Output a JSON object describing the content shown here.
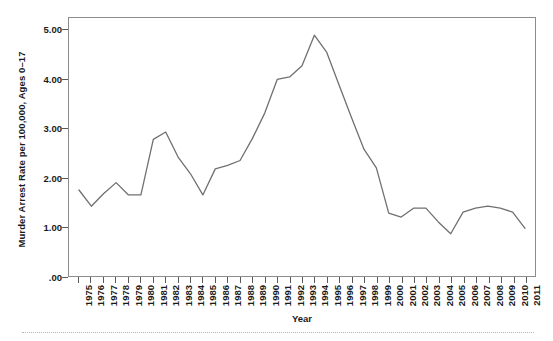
{
  "chart_data": {
    "type": "line",
    "title": "",
    "xlabel": "Year",
    "ylabel": "Murder Arrest Rate per 100,000, Ages 0–17",
    "xlim": [
      1975,
      2011
    ],
    "ylim": [
      0.0,
      5.25
    ],
    "grid": false,
    "legend": null,
    "line_color": "#707070",
    "frame_color": "#8c8c8c",
    "y_ticks": [
      {
        "value": 0.0,
        "label": ".00"
      },
      {
        "value": 1.0,
        "label": "1.00"
      },
      {
        "value": 2.0,
        "label": "2.00"
      },
      {
        "value": 3.0,
        "label": "3.00"
      },
      {
        "value": 4.0,
        "label": "4.00"
      },
      {
        "value": 5.0,
        "label": "5.00"
      }
    ],
    "categories": [
      "1975",
      "1976",
      "1977",
      "1978",
      "1979",
      "1980",
      "1981",
      "1982",
      "1983",
      "1984",
      "1985",
      "1986",
      "1987",
      "1988",
      "1989",
      "1990",
      "1991",
      "1992",
      "1993",
      "1994",
      "1995",
      "1996",
      "1997",
      "1998",
      "1999",
      "2000",
      "2001",
      "2002",
      "2003",
      "2004",
      "2005",
      "2006",
      "2007",
      "2008",
      "2009",
      "2010",
      "2011"
    ],
    "values": [
      1.75,
      1.42,
      1.68,
      1.9,
      1.65,
      1.65,
      2.78,
      2.93,
      2.42,
      2.08,
      1.65,
      2.18,
      2.25,
      2.35,
      2.8,
      3.32,
      4.0,
      4.05,
      4.28,
      4.9,
      4.55,
      3.88,
      3.22,
      2.58,
      2.2,
      1.28,
      1.2,
      1.38,
      1.38,
      1.1,
      0.86,
      1.3,
      1.38,
      1.42,
      1.38,
      1.3,
      0.97
    ]
  }
}
